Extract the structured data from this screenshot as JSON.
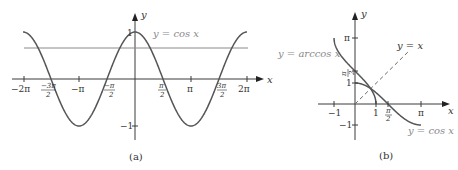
{
  "panel_a": {
    "caption": "(a)",
    "curve_label": "y = cos x",
    "axis_x_label": "x",
    "axis_y_label": "y",
    "x_ticks": [
      {
        "label": "−2π",
        "value": -6.2832
      },
      {
        "num": "−3π",
        "den": "2",
        "value": -4.7124
      },
      {
        "label": "−π",
        "value": -3.1416
      },
      {
        "num": "−π",
        "den": "2",
        "value": -1.5708
      },
      {
        "num": "π",
        "den": "2",
        "value": 1.5708
      },
      {
        "label": "π",
        "value": 3.1416
      },
      {
        "num": "3π",
        "den": "2",
        "value": 4.7124
      },
      {
        "label": "2π",
        "value": 6.2832
      }
    ],
    "y_ticks": [
      {
        "label": "1",
        "value": 1
      },
      {
        "label": "−1",
        "value": -1
      }
    ]
  },
  "panel_b": {
    "caption": "(b)",
    "arccos_label": "y = arccos x",
    "identity_label": "y = x",
    "cos_label": "y = cos x",
    "axis_x_label": "x",
    "axis_y_label": "y",
    "x_ticks": [
      {
        "label": "−1",
        "value": -1
      },
      {
        "label": "1",
        "value": 1
      },
      {
        "num": "π",
        "den": "2",
        "value": 1.5708
      },
      {
        "label": "π",
        "value": 3.1416
      }
    ],
    "y_ticks": [
      {
        "label": "π",
        "value": 3.1416
      },
      {
        "num": "π",
        "den": "2",
        "value": 1.5708
      },
      {
        "label": "1",
        "value": 1
      },
      {
        "label": "−1",
        "value": -1
      }
    ]
  },
  "chart_data": [
    {
      "type": "line",
      "title": "(a)",
      "xlabel": "x",
      "ylabel": "y",
      "xlim": [
        -6.2832,
        6.2832
      ],
      "ylim": [
        -1,
        1
      ],
      "series": [
        {
          "name": "y = cos x",
          "function": "cos(x)",
          "domain": [
            -6.2832,
            6.2832
          ]
        },
        {
          "name": "horizontal line",
          "function": "constant",
          "value": 0.66,
          "domain": [
            -6.2832,
            6.2832
          ]
        }
      ],
      "x_tick_labels": [
        "−2π",
        "−3π/2",
        "−π",
        "−π/2",
        "π/2",
        "π",
        "3π/2",
        "2π"
      ],
      "y_tick_labels": [
        "1",
        "−1"
      ],
      "grid": false
    },
    {
      "type": "line",
      "title": "(b)",
      "xlabel": "x",
      "ylabel": "y",
      "xlim": [
        -1,
        3.1416
      ],
      "ylim": [
        -1,
        3.1416
      ],
      "series": [
        {
          "name": "y = arccos x",
          "function": "arccos(x)",
          "domain": [
            -1,
            1
          ]
        },
        {
          "name": "y = cos x",
          "function": "cos(x)",
          "domain": [
            0,
            3.1416
          ]
        },
        {
          "name": "y = x",
          "function": "x",
          "domain": [
            0,
            2.6
          ],
          "style": "dashed"
        }
      ],
      "x_tick_labels": [
        "−1",
        "1",
        "π/2",
        "π"
      ],
      "y_tick_labels": [
        "π",
        "π/2",
        "1",
        "−1"
      ],
      "grid": false
    }
  ]
}
